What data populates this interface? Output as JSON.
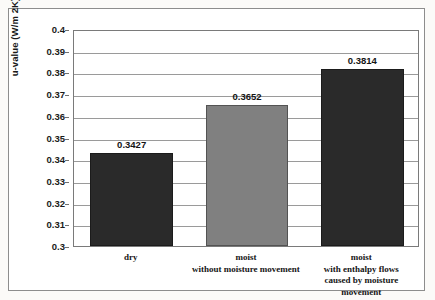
{
  "chart_data": {
    "type": "bar",
    "title": "",
    "subtitle": "",
    "xlabel": "",
    "ylabel": "u-value (W/m 2K)",
    "categories": [
      "dry",
      "moist\nwithout moisture movement",
      "moist\nwith enthalpy flows\ncaused by moisture\nmovement"
    ],
    "category_lines": [
      [
        "dry"
      ],
      [
        "moist",
        "without moisture movement"
      ],
      [
        "moist",
        "with enthalpy flows",
        "caused by moisture",
        "movement"
      ]
    ],
    "values": [
      0.3427,
      0.3652,
      0.3814
    ],
    "value_labels": [
      "0.3427",
      "0.3652",
      "0.3814"
    ],
    "bar_colors": [
      "#2a2a2a",
      "#808080",
      "#2a2a2a"
    ],
    "ylim": [
      0.3,
      0.4
    ],
    "ytick_step": 0.01,
    "ytick_labels": [
      "0.4",
      "0.39",
      "0.38",
      "0.37",
      "0.36",
      "0.35",
      "0.34",
      "0.33",
      "0.32",
      "0.31",
      "0.3"
    ],
    "ytick_values": [
      0.4,
      0.39,
      0.38,
      0.37,
      0.36,
      0.35,
      0.34,
      0.33,
      0.32,
      0.31,
      0.3
    ],
    "grid": true,
    "grid_axis": "y",
    "legend": false,
    "legend_position": "none",
    "series": [
      {
        "name": "u-value",
        "values": [
          0.3427,
          0.3652,
          0.3814
        ]
      }
    ]
  },
  "figure": {
    "frame_color": "#8d8d8d",
    "plot_border_color": "#7a7a7a",
    "gridline_color": "#9a9a9a",
    "background": "#ffffff"
  }
}
